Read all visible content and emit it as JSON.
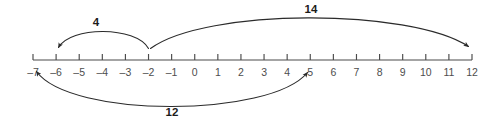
{
  "chart_data": {
    "type": "numberline",
    "title": "",
    "xlabel": "",
    "ylabel": "",
    "xlim": [
      -7,
      12
    ],
    "grid": false,
    "legend": null,
    "tick_values": [
      -7,
      -6,
      -5,
      -4,
      -3,
      -2,
      -1,
      0,
      1,
      2,
      3,
      4,
      5,
      6,
      7,
      8,
      9,
      10,
      11,
      12
    ],
    "tick_labels": [
      "–7",
      "–6",
      "–5",
      "–4",
      "–3",
      "–2",
      "–1",
      "0",
      "1",
      "2",
      "3",
      "4",
      "5",
      "6",
      "7",
      "8",
      "9",
      "10",
      "11",
      "12"
    ],
    "annotations": [
      {
        "id": "jump-4",
        "label": "4",
        "from": -2,
        "to": -6,
        "length": 4,
        "side": "above",
        "direction": "left",
        "arrowheads": [
          "to"
        ]
      },
      {
        "id": "jump-14",
        "label": "14",
        "from": -2,
        "to": 12,
        "length": 14,
        "side": "above",
        "direction": "right",
        "arrowheads": [
          "to"
        ]
      },
      {
        "id": "jump-12",
        "label": "12",
        "from": -7,
        "to": 5,
        "length": 12,
        "side": "below",
        "direction": "both",
        "arrowheads": [
          "from",
          "to"
        ]
      }
    ],
    "colors": {
      "axis": "#4a4a4a",
      "arc": "#2b2b2b",
      "tick_label": "#4d4d4d",
      "arc_label": "#1c1c1c",
      "background": "#ffffff"
    }
  },
  "geometry": {
    "axis_y": 60,
    "x_min_px": 33,
    "x_max_px": 472,
    "tick_height": 6,
    "label_y": 76
  },
  "labels": {
    "jump4": "4",
    "jump14": "14",
    "jump12": "12"
  }
}
